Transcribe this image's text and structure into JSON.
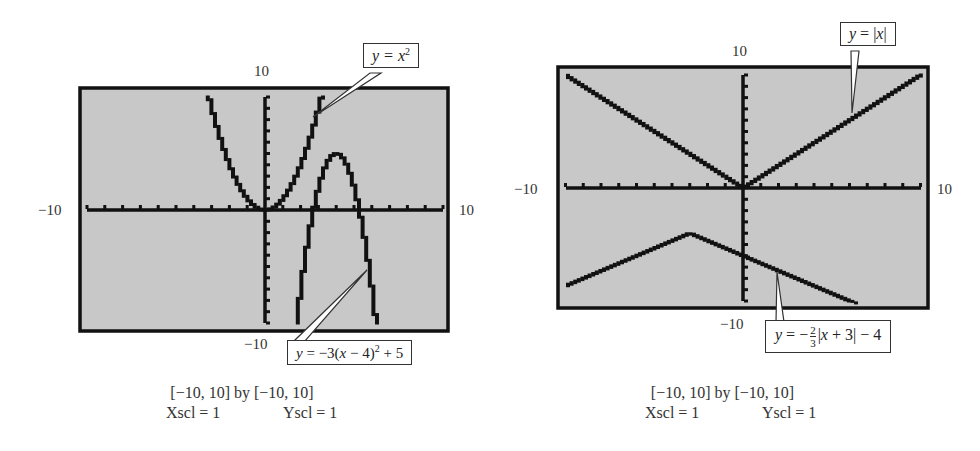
{
  "figures": [
    {
      "id": "left",
      "window": {
        "xmin": -10,
        "xmax": 10,
        "ymin": -10,
        "ymax": 10,
        "xscl": 1,
        "yscl": 1
      },
      "axis_labels": {
        "top": "10",
        "bottom": "−10",
        "left": "−10",
        "right": "10"
      },
      "caption": {
        "line1": "[−10, 10] by [−10, 10]",
        "xscl": "Xscl = 1",
        "yscl": "Yscl = 1"
      },
      "callouts": [
        {
          "id": "y-eq-x-squared",
          "text": "y = x²"
        },
        {
          "id": "y-eq-neg3-x-minus4-sq-plus5",
          "text": "y = −3(x − 4)² + 5"
        }
      ]
    },
    {
      "id": "right",
      "window": {
        "xmin": -10,
        "xmax": 10,
        "ymin": -10,
        "ymax": 10,
        "xscl": 1,
        "yscl": 1
      },
      "axis_labels": {
        "top": "10",
        "bottom": "−10",
        "left": "−10",
        "right": "10"
      },
      "caption": {
        "line1": "[−10, 10] by [−10, 10]",
        "xscl": "Xscl = 1",
        "yscl": "Yscl = 1"
      },
      "callouts": [
        {
          "id": "y-eq-abs-x",
          "text": "y = |x|"
        },
        {
          "id": "y-eq-neg-two-thirds-abs-x-plus3-minus4",
          "text": "y = −(2/3)|x + 3| − 4"
        }
      ]
    }
  ],
  "colors": {
    "screen_bg": "#c8c8c8",
    "ink": "#111111",
    "frame": "#111111"
  },
  "chart_data": [
    {
      "type": "line",
      "title": "",
      "xlabel": "",
      "ylabel": "",
      "xlim": [
        -10,
        10
      ],
      "ylim": [
        -10,
        10
      ],
      "grid": false,
      "tick_spacing": {
        "x": 1,
        "y": 1
      },
      "tick_labels": {
        "xmin": "−10",
        "xmax": "10",
        "ymin": "−10",
        "ymax": "10"
      },
      "window_caption": "[−10, 10] by [−10, 10]  Xscl = 1  Yscl = 1",
      "series": [
        {
          "name": "y = x^2",
          "x": [
            -3.2,
            -3,
            -2.5,
            -2,
            -1.5,
            -1,
            -0.5,
            0,
            0.5,
            1,
            1.5,
            2,
            2.5,
            3,
            3.2
          ],
          "y": [
            10.24,
            9,
            6.25,
            4,
            2.25,
            1,
            0.25,
            0,
            0.25,
            1,
            2.25,
            4,
            6.25,
            9,
            10.24
          ]
        },
        {
          "name": "y = -3(x-4)^2 + 5",
          "x": [
            1.7,
            2,
            2.5,
            3,
            3.5,
            4,
            4.5,
            5,
            5.5,
            6,
            6.3
          ],
          "y": [
            -10.87,
            -7,
            -1.75,
            2,
            4.25,
            5,
            4.25,
            2,
            -1.75,
            -7,
            -10.87
          ]
        }
      ]
    },
    {
      "type": "line",
      "title": "",
      "xlabel": "",
      "ylabel": "",
      "xlim": [
        -10,
        10
      ],
      "ylim": [
        -10,
        10
      ],
      "grid": false,
      "tick_spacing": {
        "x": 1,
        "y": 1
      },
      "tick_labels": {
        "xmin": "−10",
        "xmax": "10",
        "ymin": "−10",
        "ymax": "10"
      },
      "window_caption": "[−10, 10] by [−10, 10]  Xscl = 1  Yscl = 1",
      "series": [
        {
          "name": "y = |x|",
          "x": [
            -10,
            -5,
            0,
            5,
            10
          ],
          "y": [
            10,
            5,
            0,
            5,
            10
          ]
        },
        {
          "name": "y = -(2/3)|x+3| - 4",
          "x": [
            -10,
            -3,
            0,
            2,
            4,
            6
          ],
          "y": [
            -8.67,
            -4,
            -6,
            -7.33,
            -8.67,
            -10
          ]
        }
      ]
    }
  ]
}
